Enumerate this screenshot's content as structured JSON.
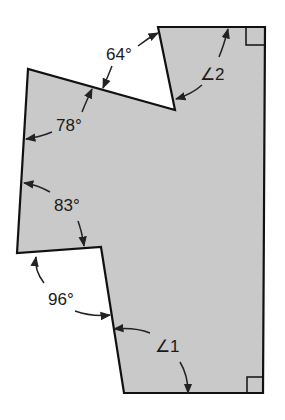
{
  "diagram": {
    "type": "geometry-polygon",
    "fill_color": "#c9c9c9",
    "stroke_color": "#111111",
    "angle_labels": [
      {
        "id": "a64",
        "text": "64°"
      },
      {
        "id": "a78",
        "text": "78°"
      },
      {
        "id": "a83",
        "text": "83°"
      },
      {
        "id": "a96",
        "text": "96°"
      },
      {
        "id": "ang2",
        "text": "∠2"
      },
      {
        "id": "ang1",
        "text": "∠1"
      }
    ],
    "right_angle_markers": 2
  }
}
